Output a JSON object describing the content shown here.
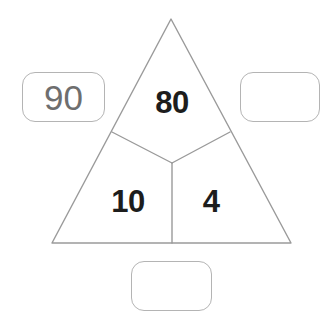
{
  "worksheet": {
    "title": "Number triangle",
    "background_color": "#ffffff",
    "stroke_color": "#9a9a9a",
    "box_stroke_color": "#b4b4b4",
    "digit_color": "#1d1d1d",
    "box_digit_color": "#6e6e6e"
  },
  "triangle": {
    "name": "segmented-triangle",
    "apex": {
      "x": 171,
      "y": 19
    },
    "bottom_left": {
      "x": 52,
      "y": 243
    },
    "bottom_right": {
      "x": 291,
      "y": 243
    },
    "junction": {
      "x": 172,
      "y": 163
    },
    "left_arm_end": {
      "x": 112,
      "y": 132
    },
    "right_arm_end": {
      "x": 230,
      "y": 132
    },
    "stem_end": {
      "x": 172,
      "y": 243
    },
    "sectors": [
      {
        "id": "top",
        "value": "80",
        "cx": 172,
        "cy": 102
      },
      {
        "id": "bottom_left",
        "value": "10",
        "cx": 128,
        "cy": 201
      },
      {
        "id": "bottom_right",
        "value": "4",
        "cx": 211,
        "cy": 201
      }
    ]
  },
  "answer_boxes": [
    {
      "id": "left",
      "value": "90",
      "filled": true
    },
    {
      "id": "right",
      "value": "",
      "filled": false
    },
    {
      "id": "bottom",
      "value": "",
      "filled": false
    }
  ]
}
